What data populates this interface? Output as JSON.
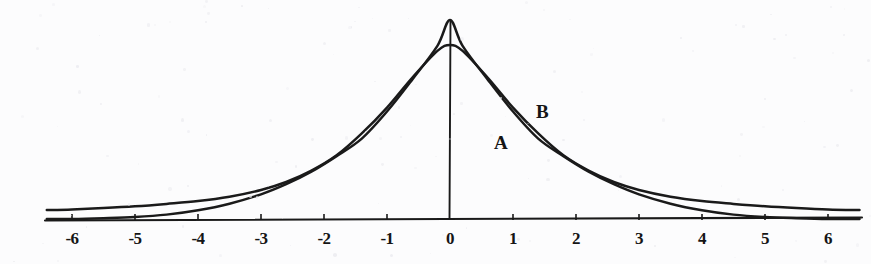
{
  "figure": {
    "background_color": "#fcfcfd",
    "ink_color": "#1a1a1a",
    "width": 871,
    "height": 264
  },
  "axis": {
    "x_origin_px": 450,
    "unit_px": 63,
    "baseline_y_px": 219,
    "left_end_px": 45,
    "right_end_px": 862,
    "vertical_axis_top_px": 20
  },
  "chart_data": {
    "type": "line",
    "title": "",
    "subtitle": "",
    "xlabel": "",
    "ylabel": "",
    "xlim": [
      -6.4,
      6.5
    ],
    "ylim": [
      0,
      1.0
    ],
    "grid": false,
    "legend_position": "inline-annotation",
    "x_ticks": [
      -6,
      -5,
      -4,
      -3,
      -2,
      -1,
      0,
      1,
      2,
      3,
      4,
      5,
      6
    ],
    "x_tick_labels": [
      "-6",
      "-5",
      "-4",
      "-3",
      "-2",
      "-1",
      "0",
      "1",
      "2",
      "3",
      "4",
      "5",
      "6"
    ],
    "y_ticks": [],
    "y_tick_labels": [],
    "annotations": [
      {
        "text": "A",
        "x": 0.95,
        "y": 0.4,
        "px_x": 494,
        "px_y": 132
      },
      {
        "text": "B",
        "x": 1.62,
        "y": 0.565,
        "px_x": 536,
        "px_y": 101
      }
    ],
    "series": [
      {
        "name": "A",
        "label": "A",
        "description": "narrow tall bell curve",
        "peak_x": 0,
        "peak_y": 1.0,
        "sigma": 1.28,
        "x": [
          -6.4,
          -6.0,
          -5.5,
          -5.0,
          -4.5,
          -4.0,
          -3.5,
          -3.0,
          -2.6,
          -2.2,
          -1.8,
          -1.4,
          -1.0,
          -0.6,
          -0.2,
          0,
          0.2,
          0.6,
          1.0,
          1.4,
          1.8,
          2.2,
          2.6,
          3.0,
          3.5,
          4.0,
          4.5,
          5.0,
          5.5,
          6.0,
          6.5
        ],
        "y": [
          0.0,
          0.0,
          0.004,
          0.01,
          0.022,
          0.044,
          0.077,
          0.124,
          0.175,
          0.238,
          0.316,
          0.404,
          0.54,
          0.7,
          0.87,
          1.0,
          0.87,
          0.7,
          0.54,
          0.404,
          0.316,
          0.238,
          0.175,
          0.124,
          0.077,
          0.044,
          0.022,
          0.01,
          0.004,
          0.0,
          0.0
        ]
      },
      {
        "name": "B",
        "label": "B",
        "description": "broad flat bell curve",
        "peak_x": 0,
        "peak_y": 0.875,
        "sigma": 1.95,
        "x": [
          -6.4,
          -6.0,
          -5.5,
          -5.0,
          -4.5,
          -4.0,
          -3.5,
          -3.0,
          -2.6,
          -2.2,
          -1.8,
          -1.4,
          -1.0,
          -0.6,
          -0.2,
          0,
          0.2,
          0.6,
          1.0,
          1.4,
          1.8,
          2.2,
          2.6,
          3.0,
          3.5,
          4.0,
          4.5,
          5.0,
          5.5,
          6.0,
          6.5
        ],
        "y": [
          0.045,
          0.048,
          0.055,
          0.064,
          0.076,
          0.09,
          0.112,
          0.146,
          0.186,
          0.243,
          0.32,
          0.43,
          0.56,
          0.71,
          0.845,
          0.875,
          0.845,
          0.71,
          0.56,
          0.43,
          0.32,
          0.243,
          0.186,
          0.146,
          0.112,
          0.09,
          0.076,
          0.064,
          0.055,
          0.048,
          0.045
        ]
      }
    ],
    "crossings": [
      {
        "label": "left-crossing",
        "x": -2.65
      },
      {
        "label": "right-crossing",
        "x": 2.78
      }
    ]
  }
}
